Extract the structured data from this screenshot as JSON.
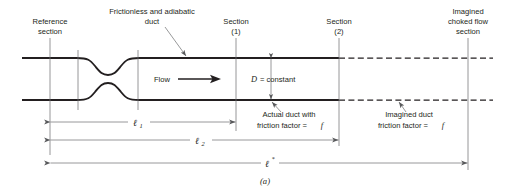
{
  "figure": {
    "caption": "(a)",
    "labels": {
      "reference_section_line1": "Reference",
      "reference_section_line2": "section",
      "frictionless_line1": "Frictionless and adiabatic",
      "frictionless_line2": "duct",
      "section1_line1": "Section",
      "section1_line2": "(1)",
      "section2_line1": "Section",
      "section2_line2": "(2)",
      "imagined_choked_line1": "Imagined",
      "imagined_choked_line2": "choked flow",
      "imagined_choked_line3": "section",
      "flow": "Flow",
      "diameter_symbol": "D",
      "diameter_value": "= constant",
      "actual_duct_line1": "Actual duct with",
      "actual_duct_line2_prefix": "friction factor =",
      "actual_duct_line2_symbol": "f",
      "imagined_duct_line1": "Imagined duct",
      "imagined_duct_line2_prefix": "friction factor =",
      "imagined_duct_line2_symbol": "f"
    },
    "dimensions": {
      "ell1_symbol": "ℓ",
      "ell1_sub": "1",
      "ell2_symbol": "ℓ",
      "ell2_sub": "2",
      "ellstar_symbol": "ℓ",
      "ellstar_sup": "*"
    },
    "colors": {
      "ink": "#231f20",
      "line_gray": "#58595b",
      "section_gray": "#6d6e71",
      "background": "#ffffff"
    }
  }
}
